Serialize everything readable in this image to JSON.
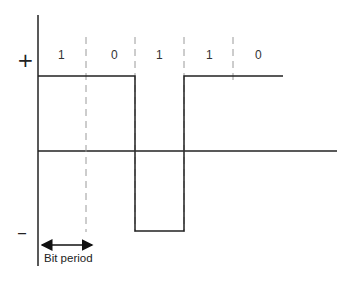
{
  "diagram": {
    "levels": {
      "positive": "+",
      "negative": "–"
    },
    "bits": [
      {
        "value": "1",
        "level": "high"
      },
      {
        "value": "0",
        "level": "high"
      },
      {
        "value": "1",
        "level": "low"
      },
      {
        "value": "1",
        "level": "high"
      },
      {
        "value": "0",
        "level": "high"
      }
    ],
    "bit_labels": [
      "1",
      "0",
      "1",
      "1",
      "0"
    ],
    "annotation": "Bit period",
    "colors": {
      "signal": "#222222",
      "dashed": "#9a9a9a",
      "text": "#333333"
    }
  }
}
